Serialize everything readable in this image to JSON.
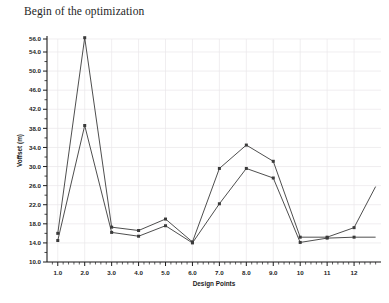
{
  "chart_data": {
    "type": "line",
    "title": "Begin of the optimization",
    "xlabel": "Design Points",
    "ylabel": "Voffset (m)",
    "x": [
      1,
      2,
      3,
      4,
      5,
      6,
      7,
      8,
      9,
      10,
      11,
      12,
      12.8
    ],
    "xtick_labels": [
      "1.0",
      "2.0",
      "3.0",
      "4.0",
      "5.0",
      "6.0",
      "7.0",
      "8.0",
      "9.0",
      "10",
      "11",
      "12"
    ],
    "xtick_values": [
      1,
      2,
      3,
      4,
      5,
      6,
      7,
      8,
      9,
      10,
      11,
      12
    ],
    "ytick_labels": [
      "10.0",
      "14.0",
      "18.0",
      "22.0",
      "26.0",
      "30.0",
      "34.0",
      "38.0",
      "42.0",
      "46.0",
      "50.0",
      "54.0",
      "56.0"
    ],
    "ytick_values": [
      10,
      14,
      18,
      22,
      26,
      30,
      34,
      38,
      42,
      46,
      50,
      54,
      56
    ],
    "xlim": [
      0.6,
      13.0
    ],
    "ylim": [
      10.0,
      57.0
    ],
    "grid": true,
    "legend": "none",
    "series": [
      {
        "name": "series-upper",
        "color": "#3a3a3a",
        "marker": "square",
        "values": [
          16.0,
          56.2,
          17.3,
          16.6,
          19.0,
          14.2,
          29.6,
          34.5,
          31.1,
          15.2,
          15.2,
          17.2,
          25.8
        ]
      },
      {
        "name": "series-lower",
        "color": "#3a3a3a",
        "marker": "square",
        "values": [
          14.5,
          38.6,
          16.2,
          15.4,
          17.6,
          14.0,
          22.2,
          29.6,
          27.6,
          14.1,
          15.0,
          15.2,
          15.2
        ]
      }
    ],
    "colors": {
      "line": "#3a3a3a",
      "grid": "#e9e6ea",
      "axis": "#1c1c1c",
      "background": "#ffffff",
      "title_text": "#1e1e1e"
    }
  }
}
